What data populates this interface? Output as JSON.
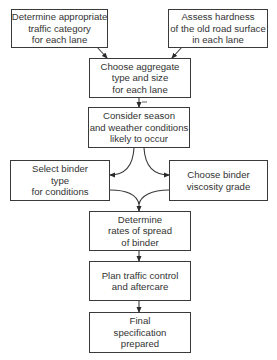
{
  "diagram": {
    "type": "flowchart",
    "nodes": [
      {
        "id": "traffic",
        "lines": [
          "Determine appropriate",
          "traffic category",
          "for each lane"
        ]
      },
      {
        "id": "hardness",
        "lines": [
          "Assess hardness",
          "of the old road surface",
          "in each lane"
        ]
      },
      {
        "id": "aggregate",
        "lines": [
          "Choose aggregate",
          "type and size",
          "for each lane"
        ]
      },
      {
        "id": "season",
        "lines": [
          "Consider season",
          "and weather conditions",
          "likely to occur"
        ]
      },
      {
        "id": "binder_type",
        "lines": [
          "Select binder",
          "type",
          "for conditions"
        ]
      },
      {
        "id": "viscosity",
        "lines": [
          "Choose binder",
          "viscosity grade"
        ]
      },
      {
        "id": "spread",
        "lines": [
          "Determine",
          "rates of spread",
          "of binder"
        ]
      },
      {
        "id": "traffic_control",
        "lines": [
          "Plan traffic control",
          "and aftercare"
        ]
      },
      {
        "id": "final",
        "lines": [
          "Final",
          "specification",
          "prepared"
        ]
      }
    ],
    "edges": [
      {
        "from": "traffic",
        "to": "aggregate"
      },
      {
        "from": "hardness",
        "to": "aggregate"
      },
      {
        "from": "aggregate",
        "to": "season"
      },
      {
        "from": "season",
        "to": "binder_type"
      },
      {
        "from": "season",
        "to": "viscosity"
      },
      {
        "from": "binder_type",
        "to": "spread"
      },
      {
        "from": "viscosity",
        "to": "spread"
      },
      {
        "from": "spread",
        "to": "traffic_control"
      },
      {
        "from": "traffic_control",
        "to": "final"
      }
    ],
    "colors": {
      "line": "#3a3a3a",
      "text": "#333333",
      "background": "#ffffff"
    }
  },
  "caption_fragment": "' ` ' ' ' ' ' ` ' ' '"
}
